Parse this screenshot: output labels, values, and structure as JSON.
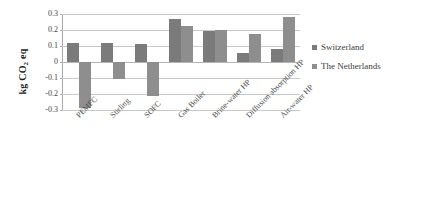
{
  "chart_data": {
    "type": "bar",
    "title": "",
    "subtitle": "",
    "xlabel": "",
    "ylabel": "kg CO2 eq",
    "ylabel_parts": {
      "prefix": "kg CO",
      "sub": "2",
      "suffix": " eq"
    },
    "categories": [
      "PEMFC",
      "Stirling",
      "SOFC",
      "Gas Boiler",
      "Brine-water HP",
      "Diffusion absorption HP",
      "Air-water HP"
    ],
    "series": [
      {
        "name": "Switzerland",
        "color": "#7b7b7b",
        "values": [
          0.12,
          0.12,
          0.115,
          0.27,
          0.195,
          0.055,
          0.08
        ]
      },
      {
        "name": "The Netherlands",
        "color": "#8e8e8e",
        "values": [
          -0.29,
          -0.105,
          -0.215,
          0.225,
          0.2,
          0.175,
          0.28
        ]
      }
    ],
    "ylim": [
      -0.3,
      0.3
    ],
    "ytick_labels": [
      "0.3",
      "0.2",
      "0.1",
      "0",
      "-0.1",
      "-0.2",
      "-0.3"
    ],
    "ytick_values": [
      0.3,
      0.2,
      0.1,
      0,
      -0.1,
      -0.2,
      -0.3
    ],
    "grid": true,
    "legend_position": "right",
    "legend_entries": [
      "Switzerland",
      "The Netherlands"
    ]
  }
}
